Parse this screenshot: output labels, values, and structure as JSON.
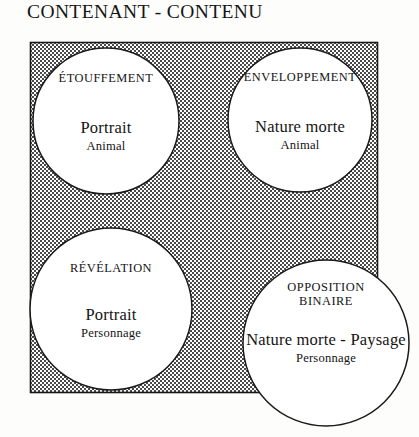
{
  "title": "CONTENANT - CONTENU",
  "colors": {
    "background": "#fdfdfb",
    "ink": "#141414",
    "shading": "#8a8a8a",
    "circle_fill": "#ffffff"
  },
  "diagram": {
    "square": {
      "name": "shaded-square",
      "x": 30,
      "y": 42,
      "width": 348,
      "height": 351,
      "fill": "halftone-dots"
    },
    "circles": [
      {
        "id": "etouffement",
        "heading": "ÉTOUFFEMENT",
        "main": "Portrait",
        "sub": "Animal",
        "cx": 106,
        "cy": 121,
        "r": 73
      },
      {
        "id": "enveloppement",
        "heading": "ENVELOPPEMENT",
        "main": "Nature morte",
        "sub": "Animal",
        "cx": 300,
        "cy": 120,
        "r": 72
      },
      {
        "id": "revelation",
        "heading": "RÉVÉLATION",
        "main": "Portrait",
        "sub": "Personnage",
        "cx": 111,
        "cy": 309,
        "r": 81
      },
      {
        "id": "opposition-binaire",
        "heading": "OPPOSITION\nBINAIRE",
        "main": "Nature morte - Paysage",
        "sub": "Personnage",
        "cx": 326,
        "cy": 343,
        "r": 83
      }
    ]
  },
  "labels": {
    "c1_heading": "ÉTOUFFEMENT",
    "c1_main": "Portrait",
    "c1_sub": "Animal",
    "c2_heading": "ENVELOPPEMENT",
    "c2_main": "Nature morte",
    "c2_sub": "Animal",
    "c3_heading": "RÉVÉLATION",
    "c3_main": "Portrait",
    "c3_sub": "Personnage",
    "c4_heading": "OPPOSITION\nBINAIRE",
    "c4_main": "Nature morte - Paysage",
    "c4_sub": "Personnage"
  }
}
